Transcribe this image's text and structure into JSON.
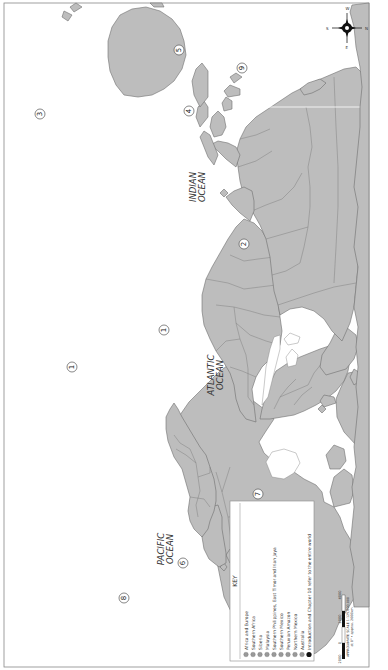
{
  "map": {
    "orientation": "rotated 90° counter-clockwise (north points right)",
    "colors": {
      "land": "#bdbdbd",
      "land_stroke": "#6e6e6e",
      "background": "#ffffff",
      "frame": "#888888"
    },
    "oceans": [
      {
        "name_line1": "PACIFIC",
        "name_line2": "OCEAN"
      },
      {
        "name_line1": "ATLANTIC",
        "name_line2": "OCEAN"
      },
      {
        "name_line1": "INDIAN",
        "name_line2": "OCEAN"
      }
    ],
    "markers": [
      {
        "number": "1",
        "region": "Africa and Europe"
      },
      {
        "number": "1",
        "region": "Africa and Europe"
      },
      {
        "number": "2",
        "region": "Southern Africa"
      },
      {
        "number": "3",
        "region": "Siberia"
      },
      {
        "number": "4",
        "region": "Malaysia"
      },
      {
        "number": "5",
        "region": "Southern Philippines, East Timor and Irian Jaya"
      },
      {
        "number": "6",
        "region": "Southern Mexico"
      },
      {
        "number": "7",
        "region": "Peruvian Amazon"
      },
      {
        "number": "8",
        "region": "Northern Mexico"
      },
      {
        "number": "9",
        "region": "Australia"
      }
    ],
    "compass": {
      "north": "N",
      "south": "S",
      "east": "E",
      "west": "W"
    }
  },
  "key": {
    "title": "KEY",
    "items": [
      {
        "number": "1",
        "label": "Africa and Europe"
      },
      {
        "number": "2",
        "label": "Southern Africa"
      },
      {
        "number": "3",
        "label": "Siberia"
      },
      {
        "number": "4",
        "label": "Malaysia"
      },
      {
        "number": "5",
        "label": "Southern Philippines, East Timor and Irian Jaya"
      },
      {
        "number": "6",
        "label": "Southern Mexico"
      },
      {
        "number": "7",
        "label": "Peruvian Amazon"
      },
      {
        "number": "8",
        "label": "Northern Mexico"
      },
      {
        "number": "9",
        "label": "Australia"
      }
    ],
    "footer_icon": "globe-icon",
    "footer": "Introduction and Chapter 10 refer to the entire world"
  },
  "scale": {
    "ticks": [
      "2000",
      "0",
      "2000",
      "4000"
    ],
    "label_line1": "APPROXIMATE SCALE 1:125,000,000",
    "label_line2": "at 0° • approx. 2000km"
  }
}
